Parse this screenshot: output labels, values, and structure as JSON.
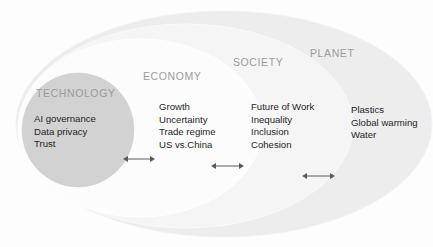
{
  "diagram": {
    "type": "nested-ellipses",
    "title": "",
    "colors": {
      "planet_fill": "#eeeeee",
      "society_fill": "#f4f4f4",
      "economy_fill": "#fbfbfb",
      "technology_fill": "#d2d2d2",
      "background": "#fdfdfd",
      "label_color": "#9b9b9b",
      "item_color": "#1f1f1f",
      "arrow_color": "#5a5a5a"
    },
    "rings": [
      {
        "id": "technology",
        "label": "TECHNOLOGY",
        "items": [
          "AI governance",
          "Data privacy",
          "Trust"
        ]
      },
      {
        "id": "economy",
        "label": "ECONOMY",
        "items": [
          "Growth",
          "Uncertainty",
          "Trade regime",
          "US vs.China"
        ]
      },
      {
        "id": "society",
        "label": "SOCIETY",
        "items": [
          "Future of Work",
          "Inequality",
          "Inclusion",
          "Cohesion"
        ]
      },
      {
        "id": "planet",
        "label": "PLANET",
        "items": [
          "Plastics",
          "Global warming",
          "Water"
        ]
      }
    ],
    "connectors": [
      {
        "id": "technology-economy",
        "kind": "double-arrow"
      },
      {
        "id": "economy-society",
        "kind": "double-arrow"
      },
      {
        "id": "society-planet",
        "kind": "double-arrow"
      }
    ]
  }
}
